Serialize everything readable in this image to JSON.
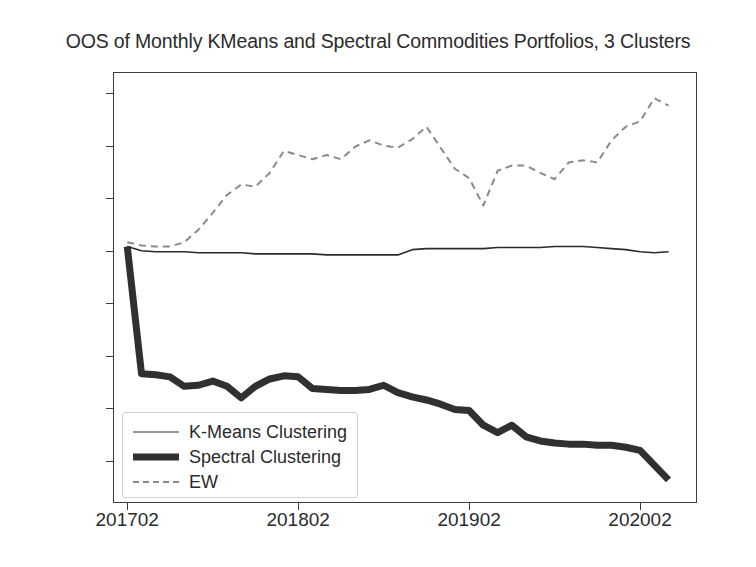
{
  "chart_data": {
    "type": "line",
    "title": "OOS of Monthly KMeans and Spectral Commodities Portfolios, 3 Clusters",
    "xlabel": "",
    "ylabel": "",
    "grid": false,
    "legend_position": "lower left",
    "xtick_labels": [
      "201702",
      "201802",
      "201902",
      "202002"
    ],
    "xtick_values": [
      201702,
      201802,
      201902,
      202002
    ],
    "ytick_labels": [
      "15.0%",
      "10.0%",
      "5.0%",
      "0.0%",
      "−5.0%",
      "−10.0%",
      "−15.0%",
      "−20.0%"
    ],
    "ytick_values": [
      15.0,
      10.0,
      5.0,
      0.0,
      -5.0,
      -10.0,
      -15.0,
      -20.0
    ],
    "ylim": [
      -24.0,
      17.0
    ],
    "xlim": [
      201701.0,
      202006.0
    ],
    "x": [
      "201702",
      "201703",
      "201704",
      "201705",
      "201706",
      "201707",
      "201708",
      "201709",
      "201710",
      "201711",
      "201712",
      "201801",
      "201802",
      "201803",
      "201804",
      "201805",
      "201806",
      "201807",
      "201808",
      "201809",
      "201810",
      "201811",
      "201812",
      "201901",
      "201902",
      "201903",
      "201904",
      "201905",
      "201906",
      "201907",
      "201908",
      "201909",
      "201910",
      "201911",
      "201912",
      "202001",
      "202002",
      "202003",
      "202004"
    ],
    "series": [
      {
        "name": "K-Means Clustering",
        "style": "solid-thin",
        "color": "#2b2b2b",
        "values": [
          0.4,
          0.0,
          -0.1,
          -0.1,
          -0.1,
          -0.2,
          -0.2,
          -0.2,
          -0.2,
          -0.3,
          -0.3,
          -0.3,
          -0.3,
          -0.3,
          -0.4,
          -0.4,
          -0.4,
          -0.4,
          -0.4,
          -0.4,
          0.1,
          0.2,
          0.2,
          0.2,
          0.2,
          0.2,
          0.3,
          0.3,
          0.3,
          0.3,
          0.4,
          0.4,
          0.4,
          0.3,
          0.2,
          0.1,
          -0.1,
          -0.2,
          -0.1
        ]
      },
      {
        "name": "Spectral Clustering",
        "style": "solid-thick",
        "color": "#303030",
        "values": [
          0.4,
          -11.7,
          -11.8,
          -12.0,
          -12.9,
          -12.8,
          -12.4,
          -12.9,
          -14.0,
          -12.9,
          -12.2,
          -11.9,
          -12.0,
          -13.1,
          -13.2,
          -13.3,
          -13.3,
          -13.2,
          -12.8,
          -13.5,
          -13.9,
          -14.2,
          -14.6,
          -15.1,
          -15.2,
          -16.6,
          -17.3,
          -16.6,
          -17.7,
          -18.1,
          -18.3,
          -18.4,
          -18.4,
          -18.5,
          -18.5,
          -18.7,
          -19.0,
          -20.4,
          -21.8
        ]
      },
      {
        "name": "EW",
        "style": "dashed",
        "color": "#8a8a8a",
        "values": [
          0.8,
          0.5,
          0.4,
          0.4,
          0.8,
          2.0,
          3.6,
          5.3,
          6.3,
          6.1,
          7.4,
          9.5,
          9.1,
          8.7,
          9.1,
          8.7,
          9.9,
          10.5,
          10.0,
          9.8,
          10.6,
          11.8,
          9.8,
          7.8,
          6.9,
          4.3,
          7.6,
          8.1,
          8.1,
          7.4,
          6.8,
          8.4,
          8.6,
          8.4,
          10.5,
          11.8,
          12.3,
          14.5,
          13.8
        ]
      }
    ]
  },
  "legend": {
    "items": [
      {
        "label": "K-Means Clustering",
        "style": "solid-thin"
      },
      {
        "label": "Spectral Clustering",
        "style": "solid-thick"
      },
      {
        "label": "EW",
        "style": "dashed"
      }
    ]
  }
}
